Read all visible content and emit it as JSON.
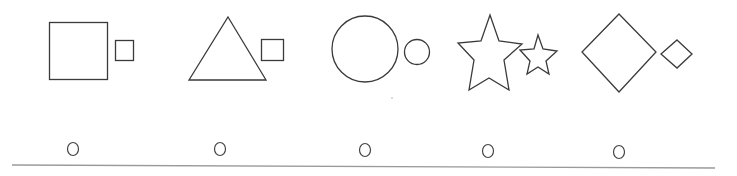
{
  "worksheet": {
    "instruction": "",
    "items": [
      {
        "id": 1,
        "big_shape": "square",
        "small_shape": "square",
        "option_label": "O"
      },
      {
        "id": 2,
        "big_shape": "triangle",
        "small_shape": "square",
        "option_label": "O"
      },
      {
        "id": 3,
        "big_shape": "circle",
        "small_shape": "circle",
        "option_label": "O"
      },
      {
        "id": 4,
        "big_shape": "star",
        "small_shape": "star",
        "option_label": "O"
      },
      {
        "id": 5,
        "big_shape": "diamond",
        "small_shape": "diamond",
        "option_label": "O"
      }
    ],
    "stroke_color": "#3a3a3a",
    "rule_color": "#9a9a9a"
  }
}
